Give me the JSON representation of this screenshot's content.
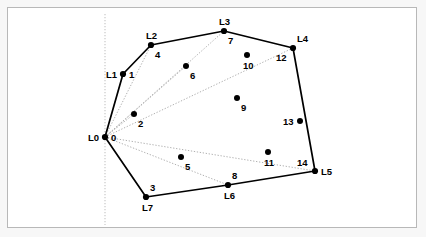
{
  "figure": {
    "title": "",
    "background": "#ffffff",
    "frame_color": "#b8b8b8",
    "outer_background": "#f7f7f7",
    "width": 426,
    "height": 237
  },
  "colors": {
    "point": "#000000",
    "hull_edge": "#000000",
    "ray": "#b0b0b0",
    "axis_line": "#c8c8c8",
    "label": "#000000"
  },
  "chart_data": {
    "type": "scatter",
    "title": "",
    "xlabel": "",
    "ylabel": "",
    "grid": false,
    "legend": null,
    "points": [
      {
        "index": "0",
        "vertex": "L0",
        "x": 105,
        "y": 137,
        "on_hull": true,
        "label_index_pos": "right",
        "label_vertex_pos": "left"
      },
      {
        "index": "1",
        "vertex": "L1",
        "x": 123,
        "y": 74,
        "on_hull": true,
        "label_index_pos": "right",
        "label_vertex_pos": "left"
      },
      {
        "index": "2",
        "vertex": "",
        "x": 134,
        "y": 114,
        "on_hull": false,
        "label_index_pos": "below-right",
        "label_vertex_pos": ""
      },
      {
        "index": "3",
        "vertex": "L7",
        "x": 146,
        "y": 197,
        "on_hull": true,
        "label_index_pos": "above-right",
        "label_vertex_pos": "below"
      },
      {
        "index": "4",
        "vertex": "L2",
        "x": 151,
        "y": 45,
        "on_hull": true,
        "label_index_pos": "below-right",
        "label_vertex_pos": "above"
      },
      {
        "index": "5",
        "vertex": "",
        "x": 181,
        "y": 157,
        "on_hull": false,
        "label_index_pos": "below-right",
        "label_vertex_pos": ""
      },
      {
        "index": "6",
        "vertex": "",
        "x": 186,
        "y": 66,
        "on_hull": false,
        "label_index_pos": "below-right",
        "label_vertex_pos": ""
      },
      {
        "index": "7",
        "vertex": "L3",
        "x": 224,
        "y": 31,
        "on_hull": true,
        "label_index_pos": "below-right",
        "label_vertex_pos": "above"
      },
      {
        "index": "8",
        "vertex": "L6",
        "x": 228,
        "y": 185,
        "on_hull": true,
        "label_index_pos": "above-right",
        "label_vertex_pos": "below"
      },
      {
        "index": "9",
        "vertex": "",
        "x": 237,
        "y": 98,
        "on_hull": false,
        "label_index_pos": "below-right",
        "label_vertex_pos": ""
      },
      {
        "index": "10",
        "vertex": "",
        "x": 247,
        "y": 55,
        "on_hull": false,
        "label_index_pos": "below",
        "label_vertex_pos": ""
      },
      {
        "index": "11",
        "vertex": "",
        "x": 268,
        "y": 152,
        "on_hull": false,
        "label_index_pos": "below",
        "label_vertex_pos": ""
      },
      {
        "index": "12",
        "vertex": "L4",
        "x": 293,
        "y": 48,
        "on_hull": true,
        "label_index_pos": "below-left",
        "label_vertex_pos": "above-right"
      },
      {
        "index": "13",
        "vertex": "",
        "x": 300,
        "y": 121,
        "on_hull": false,
        "label_index_pos": "left",
        "label_vertex_pos": ""
      },
      {
        "index": "14",
        "vertex": "L5",
        "x": 315,
        "y": 171,
        "on_hull": true,
        "label_index_pos": "above-left",
        "label_vertex_pos": "right"
      }
    ],
    "hull_order": [
      "L0",
      "L1",
      "L2",
      "L3",
      "L4",
      "L5",
      "L6",
      "L7"
    ],
    "pivot": "L0",
    "rays_from_pivot_to": [
      "L1",
      "L2",
      "L3",
      "L4",
      "L5",
      "L6",
      "L7",
      "2",
      "6"
    ],
    "vertical_reference_line": {
      "x": 105,
      "y_top": 14,
      "y_bottom": 225,
      "style": "dotted"
    }
  },
  "labels": {
    "vertices": [
      "L0",
      "L1",
      "L2",
      "L3",
      "L4",
      "L5",
      "L6",
      "L7"
    ],
    "indices": [
      "0",
      "1",
      "2",
      "3",
      "4",
      "5",
      "6",
      "7",
      "8",
      "9",
      "10",
      "11",
      "12",
      "13",
      "14"
    ]
  }
}
